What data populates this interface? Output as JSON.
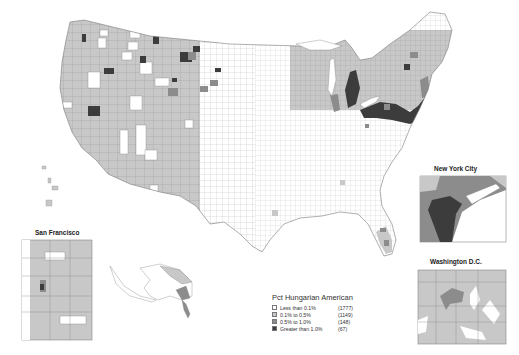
{
  "map": {
    "subject": "Pct Hungarian American by county",
    "projection": "Contiguous United States with Alaska and Hawaii repositioned",
    "insets": [
      {
        "id": "san-francisco",
        "title": "San Francisco"
      },
      {
        "id": "new-york-city",
        "title": "New York City"
      },
      {
        "id": "washington-dc",
        "title": "Washington D.C."
      }
    ]
  },
  "legend": {
    "title": "Pct Hungarian American",
    "classes": [
      {
        "label": "Less than 0.1%",
        "count": "(1777)",
        "color": "#ffffff"
      },
      {
        "label": "0.1% to 0.5%",
        "count": "(1149)",
        "color": "#c8c8c8"
      },
      {
        "label": "0.5% to 1.0%",
        "count": "(148)",
        "color": "#8c8c8c"
      },
      {
        "label": "Greater than 1.0%",
        "count": "(67)",
        "color": "#3c3c3c"
      }
    ]
  },
  "colors": {
    "background": "#ffffff",
    "border": "#777777",
    "low": "#ffffff",
    "mid_low": "#c8c8c8",
    "mid_high": "#8c8c8c",
    "high": "#3c3c3c"
  }
}
